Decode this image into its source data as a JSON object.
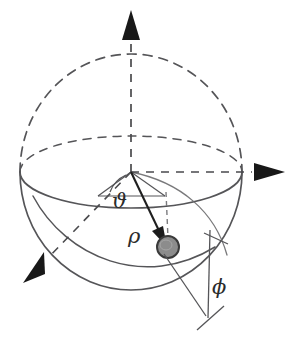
{
  "figure": {
    "kind": "spherical-coordinate-diagram",
    "background_color": "#ffffff",
    "stroke_color": "#555558",
    "arrow_color": "#1c1c1c",
    "label_color": "#2b2b2b",
    "point_fill_color": "#8c8c8c",
    "point_stroke_color": "#3a3a3a"
  },
  "labels": {
    "polar_angle": "ϑ",
    "radius": "ρ",
    "azimuth_angle": "ϕ"
  },
  "axes": [
    {
      "name": "z-axis",
      "direction": "up",
      "style": "dashed",
      "arrowhead": "solid-triangle"
    },
    {
      "name": "y-axis",
      "direction": "right",
      "style": "dashed",
      "arrowhead": "solid-triangle"
    },
    {
      "name": "x-axis",
      "direction": "down-left",
      "style": "dashed",
      "arrowhead": "solid-triangle"
    }
  ],
  "sphere": {
    "center_x": 131,
    "center_y": 172,
    "radius_x": 111,
    "radius_y": 118,
    "upper_outline_style": "dashed",
    "lower_outline_style": "solid",
    "equator_front_style": "solid",
    "equator_back_style": "dashed"
  },
  "point": {
    "name": "particle",
    "x": 168,
    "y": 247,
    "radius": 11
  }
}
